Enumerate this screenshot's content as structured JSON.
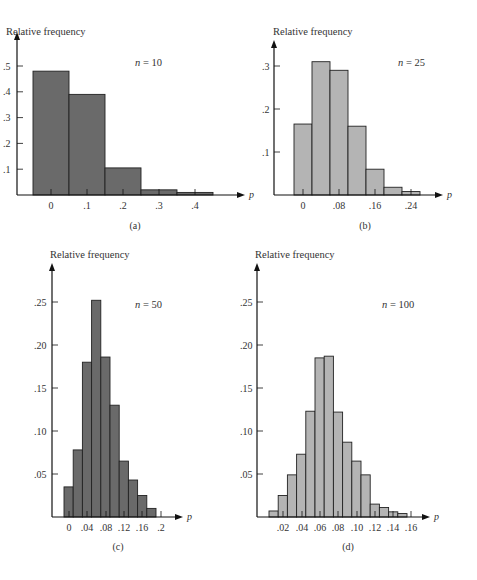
{
  "colors": {
    "dark_bar": "#6a6a6a",
    "light_bar": "#b4b4b4",
    "axis": "#111111",
    "edge": "#222222"
  },
  "chart_data": [
    {
      "id": "a",
      "type": "bar",
      "panel_label": "(a)",
      "annotation": "n = 10",
      "annotation_var": "n",
      "annotation_val": "10",
      "ylabel": "Relative frequency",
      "xlabel": "p",
      "x_ticks": [
        "0",
        ".1",
        ".2",
        ".3",
        ".4"
      ],
      "y_ticks": [
        ".1",
        ".2",
        ".3",
        ".4",
        ".5"
      ],
      "categories": [
        0,
        0.1,
        0.2,
        0.3,
        0.4
      ],
      "values": [
        0.48,
        0.39,
        0.105,
        0.02,
        0.01
      ],
      "ylim": [
        0,
        0.55
      ],
      "fill": "dark"
    },
    {
      "id": "b",
      "type": "bar",
      "panel_label": "(b)",
      "annotation": "n = 25",
      "annotation_var": "n",
      "annotation_val": "25",
      "ylabel": "Relative frequency",
      "xlabel": "p",
      "x_ticks": [
        "0",
        ".08",
        ".16",
        ".24"
      ],
      "y_ticks": [
        ".1",
        ".2",
        ".3"
      ],
      "categories": [
        0,
        0.04,
        0.08,
        0.12,
        0.16,
        0.2,
        0.24
      ],
      "values": [
        0.165,
        0.31,
        0.29,
        0.16,
        0.06,
        0.018,
        0.008
      ],
      "ylim": [
        0,
        0.33
      ],
      "fill": "light"
    },
    {
      "id": "c",
      "type": "bar",
      "panel_label": "(c)",
      "annotation": "n = 50",
      "annotation_var": "n",
      "annotation_val": "50",
      "ylabel": "Relative frequency",
      "xlabel": "p",
      "x_ticks": [
        "0",
        ".04",
        ".08",
        ".12",
        ".16",
        ".2"
      ],
      "y_ticks": [
        ".05",
        ".10",
        ".15",
        ".20",
        ".25"
      ],
      "categories": [
        0,
        0.02,
        0.04,
        0.06,
        0.08,
        0.1,
        0.12,
        0.14,
        0.16,
        0.18
      ],
      "values": [
        0.035,
        0.078,
        0.18,
        0.252,
        0.186,
        0.13,
        0.065,
        0.043,
        0.025,
        0.01
      ],
      "ylim": [
        0,
        0.28
      ],
      "fill": "dark"
    },
    {
      "id": "d",
      "type": "bar",
      "panel_label": "(d)",
      "annotation": "n = 100",
      "annotation_var": "n",
      "annotation_val": "100",
      "ylabel": "Relative frequency",
      "xlabel": "p",
      "x_ticks": [
        ".02",
        ".04",
        ".06",
        ".08",
        ".10",
        ".12",
        ".14",
        ".16"
      ],
      "y_ticks": [
        ".05",
        ".10",
        ".15",
        ".20",
        ".25"
      ],
      "categories": [
        0.01,
        0.02,
        0.03,
        0.04,
        0.05,
        0.06,
        0.07,
        0.08,
        0.09,
        0.1,
        0.11,
        0.12,
        0.13,
        0.14,
        0.15
      ],
      "values": [
        0.007,
        0.025,
        0.049,
        0.073,
        0.123,
        0.185,
        0.187,
        0.122,
        0.087,
        0.065,
        0.049,
        0.015,
        0.011,
        0.006,
        0.004
      ],
      "ylim": [
        0,
        0.28
      ],
      "fill": "light"
    }
  ]
}
